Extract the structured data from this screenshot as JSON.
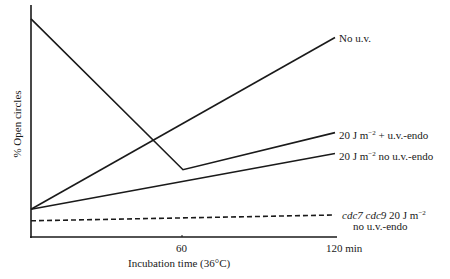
{
  "chart_data": {
    "type": "line",
    "title": "",
    "xlabel": "Incubation time (36°C)",
    "ylabel": "% Open circles",
    "x": [
      0,
      60,
      120
    ],
    "x_tick_labels": [
      "60",
      "120 min"
    ],
    "x_ticks": [
      60,
      120
    ],
    "xlim": [
      0,
      120
    ],
    "ylim": [
      0,
      100
    ],
    "y_units": "arbitrary (no y tick labels shown)",
    "grid": false,
    "legend_position": "inline labels at right end of each line",
    "series": [
      {
        "name": "No u.v.",
        "style": "solid",
        "x": [
          0,
          120
        ],
        "values": [
          12,
          86
        ]
      },
      {
        "name": "20 J m−2 + u.v.-endo",
        "style": "solid",
        "x": [
          0,
          60,
          120
        ],
        "values": [
          94,
          29,
          45
        ]
      },
      {
        "name": "20 J m−2 no u.v.-endo",
        "style": "solid",
        "x": [
          0,
          120
        ],
        "values": [
          12,
          36
        ]
      },
      {
        "name": "cdc7 cdc9 20 J m−2 no u.v.-endo",
        "style": "dashed",
        "x": [
          0,
          120
        ],
        "values": [
          7,
          9.5
        ]
      }
    ]
  },
  "labels": {
    "ylabel": "% Open circles",
    "xlabel": "Incubation time (36°C)",
    "tick_60": "60",
    "tick_120": "120 min",
    "no_uv": "No u.v.",
    "uv_endo_prefix": "20 J m",
    "uv_endo_exp": "−2",
    "uv_endo_suffix": " + u.v.-endo",
    "no_endo_prefix": "20 J m",
    "no_endo_exp": "−2",
    "no_endo_suffix": " no u.v.-endo",
    "cdc_genes": "cdc7 cdc9",
    "cdc_dose": " 20 J m",
    "cdc_exp": "−2",
    "cdc_line2": "no u.v.-endo"
  },
  "colors": {
    "ink": "#1a1a1a",
    "background": "#ffffff"
  }
}
